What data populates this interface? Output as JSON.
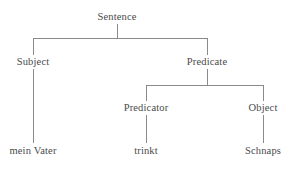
{
  "diagram": {
    "type": "syntax-tree",
    "background_color": "#ffffff",
    "line_color": "#8a8a8a",
    "text_color": "#4a4a4a",
    "nodes": [
      {
        "id": "sentence",
        "label": "Sentence",
        "x": 117,
        "y": 17,
        "level": 0,
        "kind": "category"
      },
      {
        "id": "subject",
        "label": "Subject",
        "x": 33,
        "y": 62,
        "level": 1,
        "kind": "category"
      },
      {
        "id": "predicate",
        "label": "Predicate",
        "x": 207,
        "y": 62,
        "level": 1,
        "kind": "category"
      },
      {
        "id": "predicator",
        "label": "Predicator",
        "x": 146,
        "y": 108,
        "level": 2,
        "kind": "category"
      },
      {
        "id": "object",
        "label": "Object",
        "x": 263,
        "y": 108,
        "level": 2,
        "kind": "category"
      },
      {
        "id": "mein-vater",
        "label": "mein Vater",
        "x": 33,
        "y": 151,
        "level": 3,
        "kind": "terminal"
      },
      {
        "id": "trinkt",
        "label": "trinkt",
        "x": 146,
        "y": 151,
        "level": 3,
        "kind": "terminal"
      },
      {
        "id": "schnaps",
        "label": "Schnaps",
        "x": 263,
        "y": 151,
        "level": 3,
        "kind": "terminal"
      }
    ],
    "edges": [
      {
        "id": "edge-sentence-subject",
        "from": "sentence",
        "to": "subject"
      },
      {
        "id": "edge-sentence-predicate",
        "from": "sentence",
        "to": "predicate"
      },
      {
        "id": "edge-predicate-predicator",
        "from": "predicate",
        "to": "predicator"
      },
      {
        "id": "edge-predicate-object",
        "from": "predicate",
        "to": "object"
      },
      {
        "id": "edge-subject-meinvater",
        "from": "subject",
        "to": "mein-vater"
      },
      {
        "id": "edge-predicator-trinkt",
        "from": "predicator",
        "to": "trinkt"
      },
      {
        "id": "edge-object-schnaps",
        "from": "object",
        "to": "schnaps"
      }
    ]
  }
}
